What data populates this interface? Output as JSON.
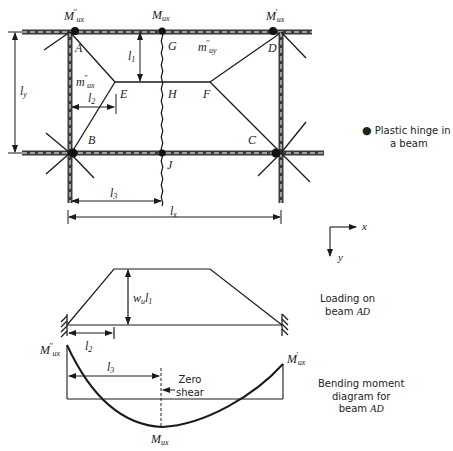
{
  "slab_plan": {
    "moment_labels": {
      "left_top": "M''ux",
      "mid_top": "Mux",
      "right_top": "M'ux"
    },
    "points": {
      "A": "A",
      "B": "B",
      "C": "C",
      "D": "D",
      "E": "E",
      "F": "F",
      "G": "G",
      "H": "H",
      "J": "J"
    },
    "slab_moments": {
      "m_uy": "m''uy",
      "m_ux": "m''ux"
    },
    "dimensions": {
      "l1": "l1",
      "l2": "l2",
      "l3": "l3",
      "lx": "lx",
      "ly": "ly"
    }
  },
  "legend": {
    "hinge_symbol": "●",
    "line1": "Plastic hinge in",
    "line2": "a beam"
  },
  "axes": {
    "x": "x",
    "y": "y"
  },
  "loading_diagram": {
    "load_label": "wul1",
    "dim_label": "l2",
    "caption_line1": "Loading on",
    "caption_line2_prefix": "beam",
    "caption_line2_italic": "AD"
  },
  "moment_diagram": {
    "left_label": "M''ux",
    "right_label": "M'ux",
    "bottom_label": "Mux",
    "dim_label": "l3",
    "zero_shear_line1": "Zero",
    "zero_shear_line2": "shear",
    "caption_line1": "Bending moment",
    "caption_line2": "diagram for",
    "caption_line3_prefix": "beam",
    "caption_line3_italic": "AD"
  },
  "colors": {
    "ink": "#1a1a1a",
    "beam": "#3a3a3a",
    "background": "#ffffff"
  }
}
